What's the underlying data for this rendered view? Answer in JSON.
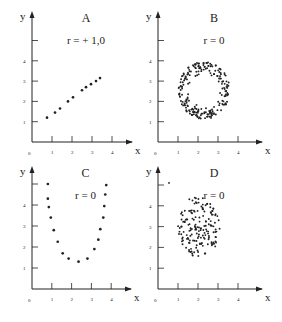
{
  "figure": {
    "background": "#ffffff",
    "ink": "#222222",
    "panels_layout": "2x2"
  },
  "chart_data": [
    {
      "id": "A",
      "type": "scatter",
      "title": "A",
      "annotation": "r = + 1,0",
      "xlabel": "x",
      "ylabel": "y",
      "x_ticks": [
        "1",
        "2",
        "3",
        "4"
      ],
      "y_ticks": [
        "1",
        "2",
        "3",
        "4"
      ],
      "origin_label": "0",
      "xlim": [
        0,
        4.5
      ],
      "ylim": [
        0,
        5.4
      ],
      "grid": false,
      "points": [
        [
          0.75,
          1.2
        ],
        [
          1.15,
          1.45
        ],
        [
          1.4,
          1.65
        ],
        [
          1.8,
          2.0
        ],
        [
          2.05,
          2.2
        ],
        [
          2.5,
          2.55
        ],
        [
          2.7,
          2.7
        ],
        [
          2.95,
          2.85
        ],
        [
          3.2,
          3.0
        ],
        [
          3.4,
          3.15
        ]
      ]
    },
    {
      "id": "B",
      "type": "scatter",
      "title": "B",
      "annotation": "r = 0",
      "xlabel": "x",
      "ylabel": "y",
      "x_ticks": [
        "1",
        "2",
        "3",
        "4"
      ],
      "y_ticks": [
        "1",
        "2",
        "3",
        "4"
      ],
      "origin_label": "0",
      "xlim": [
        0,
        4.5
      ],
      "ylim": [
        0,
        5.4
      ],
      "grid": false,
      "shape": "ring",
      "ring": {
        "cx": 2.3,
        "cy": 2.55,
        "r_inner": 0.75,
        "r_outer": 1.35,
        "n": 230
      },
      "points": []
    },
    {
      "id": "C",
      "type": "scatter",
      "title": "C",
      "annotation": "r = 0",
      "xlabel": "x",
      "ylabel": "y",
      "x_ticks": [
        "1",
        "2",
        "3",
        "4"
      ],
      "y_ticks": [
        "1",
        "2",
        "3",
        "4"
      ],
      "origin_label": "0",
      "xlim": [
        0,
        4.5
      ],
      "ylim": [
        0,
        5.4
      ],
      "grid": false,
      "points": [
        [
          0.8,
          5.0
        ],
        [
          0.8,
          4.3
        ],
        [
          0.85,
          3.9
        ],
        [
          0.95,
          3.4
        ],
        [
          1.1,
          2.8
        ],
        [
          1.3,
          2.25
        ],
        [
          1.55,
          1.7
        ],
        [
          1.85,
          1.45
        ],
        [
          2.35,
          1.3
        ],
        [
          2.8,
          1.45
        ],
        [
          3.15,
          1.9
        ],
        [
          3.35,
          2.35
        ],
        [
          3.45,
          2.85
        ],
        [
          3.6,
          3.4
        ],
        [
          3.65,
          3.95
        ],
        [
          3.7,
          4.5
        ],
        [
          3.75,
          4.95
        ]
      ]
    },
    {
      "id": "D",
      "type": "scatter",
      "title": "D",
      "annotation": "r = 0",
      "xlabel": "x",
      "ylabel": "y",
      "x_ticks": [
        "1",
        "2",
        "3",
        "4"
      ],
      "y_ticks": [
        "1",
        "2",
        "3",
        "4"
      ],
      "origin_label": "0",
      "xlim": [
        0,
        4.5
      ],
      "ylim": [
        0,
        5.4
      ],
      "grid": false,
      "shape": "cloud",
      "cloud": {
        "cx": 2.05,
        "cy": 3.0,
        "rx": 1.05,
        "ry": 1.5,
        "n": 170
      },
      "stray_point": [
        0.55,
        5.1
      ],
      "points": []
    }
  ]
}
